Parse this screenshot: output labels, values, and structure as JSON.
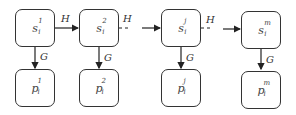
{
  "diagram": {
    "type": "chain",
    "nodes_top": [
      {
        "id": "s1",
        "base": "s",
        "sub": "i",
        "sup": "1"
      },
      {
        "id": "s2",
        "base": "s",
        "sub": "i",
        "sup": "2"
      },
      {
        "id": "sj",
        "base": "s",
        "sub": "i",
        "sup": "j"
      },
      {
        "id": "sm",
        "base": "s",
        "sub": "i",
        "sup": "m"
      }
    ],
    "nodes_bottom": [
      {
        "id": "p1",
        "base": "p",
        "sub": "i",
        "sup": "1"
      },
      {
        "id": "p2",
        "base": "p",
        "sub": "i",
        "sup": "2"
      },
      {
        "id": "pj",
        "base": "p",
        "sub": "i",
        "sup": "j"
      },
      {
        "id": "pm",
        "base": "p",
        "sub": "i",
        "sup": "m"
      }
    ],
    "edges": [
      {
        "from": "s1",
        "to": "s2",
        "label": "H",
        "style": "solid"
      },
      {
        "from": "s2",
        "to": "sj",
        "label": "H",
        "style": "dashed-then-arrow"
      },
      {
        "from": "sj",
        "to": "sm",
        "label": "H",
        "style": "dashed-then-arrow"
      },
      {
        "from": "s1",
        "to": "p1",
        "label": "G",
        "style": "solid"
      },
      {
        "from": "s2",
        "to": "p2",
        "label": "G",
        "style": "solid"
      },
      {
        "from": "sj",
        "to": "pj",
        "label": "G",
        "style": "solid"
      },
      {
        "from": "sm",
        "to": "pm",
        "label": "G",
        "style": "solid"
      }
    ],
    "edge_labels": {
      "h": "H",
      "g": "G"
    }
  }
}
